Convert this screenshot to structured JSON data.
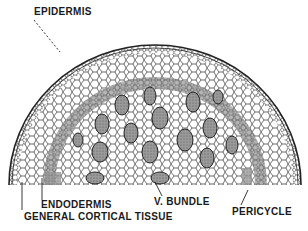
{
  "diagram": {
    "labels": {
      "epidermis": "EPIDERMIS",
      "endodermis": "ENDODERMIS",
      "v_bundle": "V. BUNDLE",
      "general_cortical_tissue": "GENERAL CORTICAL TISSUE",
      "pericycle": "PERICYCLE"
    },
    "colors": {
      "ink": "#1a1a1a",
      "band": "#8a8a8a",
      "background": "#ffffff"
    }
  }
}
